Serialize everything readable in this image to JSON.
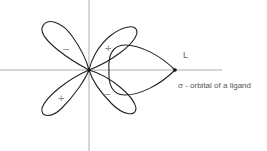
{
  "diagram": {
    "lobe_signs": {
      "upper_left": "–",
      "upper_right": "+",
      "lower_left": "+",
      "lower_right": "–"
    },
    "ligand_label": "L",
    "ligand_orbital_caption": "σ - orbital  of  a  ligand",
    "colors": {
      "outline": "#222222",
      "axes": "#9a9a9a",
      "text": "#555555"
    }
  }
}
